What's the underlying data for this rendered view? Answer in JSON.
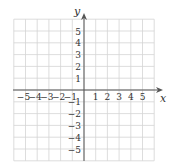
{
  "diagram": {
    "type": "coordinate-plane",
    "x_axis": {
      "label": "x",
      "min": -6,
      "max": 6,
      "ticks": [
        -5,
        -4,
        -3,
        -2,
        -1,
        1,
        2,
        3,
        4,
        5
      ],
      "tick_labels": [
        "−5",
        "−4",
        "−3",
        "−2",
        "−1",
        "1",
        "2",
        "3",
        "4",
        "5"
      ]
    },
    "y_axis": {
      "label": "y",
      "min": -6,
      "max": 6,
      "ticks": [
        5,
        4,
        3,
        2,
        1,
        -1,
        -2,
        -3,
        -4,
        -5
      ],
      "tick_labels": [
        "5",
        "4",
        "3",
        "2",
        "1",
        "−1",
        "−2",
        "−3",
        "−4",
        "−5"
      ]
    },
    "grid": {
      "visible": true,
      "color": "#d4d4d4",
      "axis_color": "#555555"
    }
  }
}
